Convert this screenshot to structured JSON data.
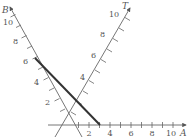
{
  "diagram": {
    "type": "oblique-axes-plot",
    "axes": [
      {
        "name": "A",
        "direction": "horizontal-right",
        "tick_labels": [
          "2",
          "4",
          "6",
          "8",
          "10"
        ]
      },
      {
        "name": "B",
        "direction": "up-left",
        "tick_labels": [
          "2",
          "4",
          "6",
          "8",
          "10"
        ]
      },
      {
        "name": "T",
        "direction": "up-right",
        "tick_labels": [
          "4",
          "6",
          "8",
          "10"
        ]
      }
    ],
    "line": {
      "from": {
        "axis": "B",
        "value": 6
      },
      "to": {
        "axis": "A",
        "value": 3
      },
      "style": "thick"
    },
    "colors": {
      "axis": "#666666",
      "line": "#333333",
      "text": "#555555"
    }
  },
  "labels": {
    "a_axis": "A",
    "b_axis": "B",
    "t_axis": "T",
    "a": [
      "2",
      "4",
      "6",
      "8",
      "10"
    ],
    "b": [
      "2",
      "4",
      "6",
      "8",
      "10"
    ],
    "t": [
      "4",
      "6",
      "8",
      "10"
    ]
  }
}
